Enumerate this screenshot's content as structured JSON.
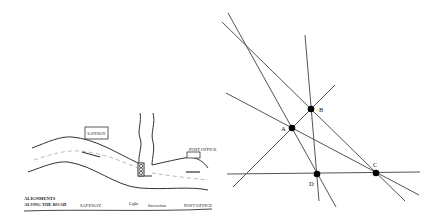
{
  "map": {
    "safeway_sign": "SAFEWAY",
    "post_office_sign": "POST OFFICE",
    "alignments_line1": "ALIGNMENTS",
    "alignments_line2": "ALONG THE ROAD",
    "align_safeway": "SAFEWAY",
    "align_light": "Light",
    "align_intersection": "Intersection",
    "align_post_office": "POST OFFICE"
  },
  "geometry": {
    "points": [
      {
        "id": "A",
        "label": "A"
      },
      {
        "id": "B",
        "label": "B"
      },
      {
        "id": "C",
        "label": "C"
      },
      {
        "id": "D",
        "label": "D"
      }
    ],
    "lines": [
      {
        "through": [
          "A",
          "D"
        ]
      },
      {
        "through": [
          "B",
          "C"
        ]
      },
      {
        "through": [
          "B",
          "D"
        ]
      },
      {
        "through": [
          "A",
          "B"
        ]
      },
      {
        "through": [
          "A",
          "C"
        ]
      },
      {
        "through": [
          "D",
          "C"
        ]
      }
    ]
  }
}
